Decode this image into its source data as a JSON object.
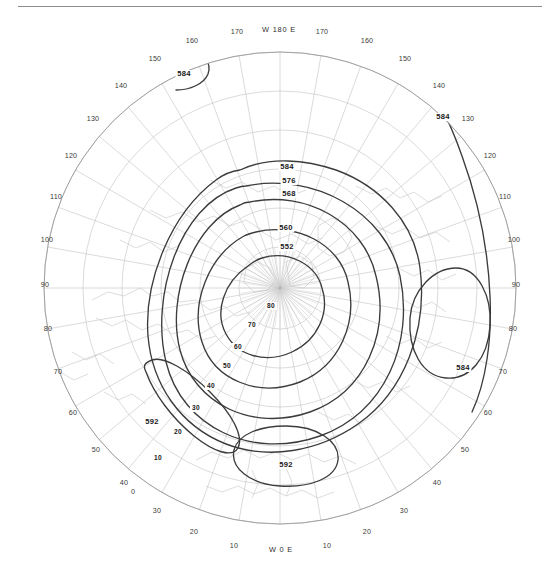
{
  "figure": {
    "kind": "polar-stereographic-contour-map",
    "projection": "Northern Hemisphere polar stereographic",
    "has_top_rule": true,
    "background_color": "#ffffff",
    "graticule_color": "#b9b9b9",
    "coastline_color": "#c2c2c2",
    "contour_color": "#3a3a3a",
    "limb_color": "#9a9a9a"
  },
  "chart_data": {
    "type": "contour",
    "title": "",
    "xlabel": "",
    "ylabel": "",
    "units": "decameters (geopotential height)",
    "contour_interval": 8,
    "contour_levels": [
      552,
      560,
      568,
      576,
      584,
      592
    ],
    "inner_minor_labels": [
      "80",
      "70"
    ],
    "labeled_contours": [
      {
        "label": "584",
        "x": 287,
        "y": 169,
        "role": "top-ridge"
      },
      {
        "label": "576",
        "x": 289,
        "y": 183,
        "role": "top-ridge"
      },
      {
        "label": "568",
        "x": 289,
        "y": 196,
        "role": "top-ridge"
      },
      {
        "label": "560",
        "x": 286,
        "y": 230,
        "role": "inner"
      },
      {
        "label": "552",
        "x": 287,
        "y": 249,
        "role": "inner"
      },
      {
        "label": "80",
        "x": 271,
        "y": 308,
        "role": "core-580"
      },
      {
        "label": "70",
        "x": 252,
        "y": 327,
        "role": "core-570"
      },
      {
        "label": "60",
        "x": 238,
        "y": 349,
        "role": "longitude-grid"
      },
      {
        "label": "50",
        "x": 227,
        "y": 368,
        "role": "longitude-grid"
      },
      {
        "label": "40",
        "x": 211,
        "y": 388,
        "role": "longitude-grid"
      },
      {
        "label": "30",
        "x": 196,
        "y": 410,
        "role": "longitude-grid"
      },
      {
        "label": "20",
        "x": 178,
        "y": 434,
        "role": "longitude-grid"
      },
      {
        "label": "10",
        "x": 158,
        "y": 460,
        "role": "longitude-grid"
      },
      {
        "label": "584",
        "x": 184,
        "y": 76,
        "role": "top-left-arc"
      },
      {
        "label": "584",
        "x": 443,
        "y": 119,
        "role": "upper-right-arc"
      },
      {
        "label": "584",
        "x": 463,
        "y": 370,
        "role": "right-closed-oval"
      },
      {
        "label": "592",
        "x": 152,
        "y": 424,
        "role": "lower-left-closed"
      },
      {
        "label": "592",
        "x": 286,
        "y": 467,
        "role": "bottom-closed-ellipse"
      }
    ],
    "axis_labels": {
      "top_center": "W 180 E",
      "bottom_center": "W 0 E"
    },
    "longitude_ticks_top": [
      "170",
      "W 180 E",
      "170"
    ],
    "longitude_ticks_bottom": [
      "10",
      "W 0 E",
      "10"
    ],
    "rim_labels": [
      {
        "text": "W 180 E",
        "x": 279,
        "y": 32,
        "anchor": "middle"
      },
      {
        "text": "170",
        "x": 237,
        "y": 34,
        "anchor": "middle"
      },
      {
        "text": "170",
        "x": 322,
        "y": 34,
        "anchor": "middle"
      },
      {
        "text": "160",
        "x": 192,
        "y": 43,
        "anchor": "middle"
      },
      {
        "text": "160",
        "x": 367,
        "y": 43,
        "anchor": "middle"
      },
      {
        "text": "150",
        "x": 155,
        "y": 61,
        "anchor": "middle"
      },
      {
        "text": "150",
        "x": 405,
        "y": 61,
        "anchor": "middle"
      },
      {
        "text": "140",
        "x": 121,
        "y": 88,
        "anchor": "middle"
      },
      {
        "text": "140",
        "x": 439,
        "y": 88,
        "anchor": "middle"
      },
      {
        "text": "130",
        "x": 93,
        "y": 121,
        "anchor": "middle"
      },
      {
        "text": "130",
        "x": 468,
        "y": 121,
        "anchor": "middle"
      },
      {
        "text": "120",
        "x": 71,
        "y": 158,
        "anchor": "middle"
      },
      {
        "text": "120",
        "x": 490,
        "y": 158,
        "anchor": "middle"
      },
      {
        "text": "110",
        "x": 56,
        "y": 199,
        "anchor": "middle"
      },
      {
        "text": "110",
        "x": 505,
        "y": 199,
        "anchor": "middle"
      },
      {
        "text": "100",
        "x": 47,
        "y": 242,
        "anchor": "middle"
      },
      {
        "text": "100",
        "x": 514,
        "y": 242,
        "anchor": "middle"
      },
      {
        "text": "90",
        "x": 45,
        "y": 287,
        "anchor": "middle"
      },
      {
        "text": "90",
        "x": 516,
        "y": 287,
        "anchor": "middle"
      },
      {
        "text": "80",
        "x": 48,
        "y": 331,
        "anchor": "middle"
      },
      {
        "text": "80",
        "x": 513,
        "y": 331,
        "anchor": "middle"
      },
      {
        "text": "70",
        "x": 58,
        "y": 374,
        "anchor": "middle"
      },
      {
        "text": "70",
        "x": 503,
        "y": 374,
        "anchor": "middle"
      },
      {
        "text": "60",
        "x": 73,
        "y": 415,
        "anchor": "middle"
      },
      {
        "text": "60",
        "x": 488,
        "y": 415,
        "anchor": "middle"
      },
      {
        "text": "50",
        "x": 96,
        "y": 452,
        "anchor": "middle"
      },
      {
        "text": "50",
        "x": 465,
        "y": 452,
        "anchor": "middle"
      },
      {
        "text": "40",
        "x": 124,
        "y": 485,
        "anchor": "middle"
      },
      {
        "text": "40",
        "x": 437,
        "y": 485,
        "anchor": "middle"
      },
      {
        "text": "30",
        "x": 157,
        "y": 513,
        "anchor": "middle"
      },
      {
        "text": "30",
        "x": 404,
        "y": 513,
        "anchor": "middle"
      },
      {
        "text": "20",
        "x": 194,
        "y": 534,
        "anchor": "middle"
      },
      {
        "text": "20",
        "x": 367,
        "y": 534,
        "anchor": "middle"
      },
      {
        "text": "10",
        "x": 234,
        "y": 548,
        "anchor": "middle"
      },
      {
        "text": "10",
        "x": 327,
        "y": 548,
        "anchor": "middle"
      },
      {
        "text": "W 0 E",
        "x": 281,
        "y": 552,
        "anchor": "middle"
      },
      {
        "text": "0",
        "x": 133,
        "y": 494,
        "anchor": "middle"
      }
    ],
    "legend": [],
    "grid": true,
    "legend_position": "none"
  }
}
